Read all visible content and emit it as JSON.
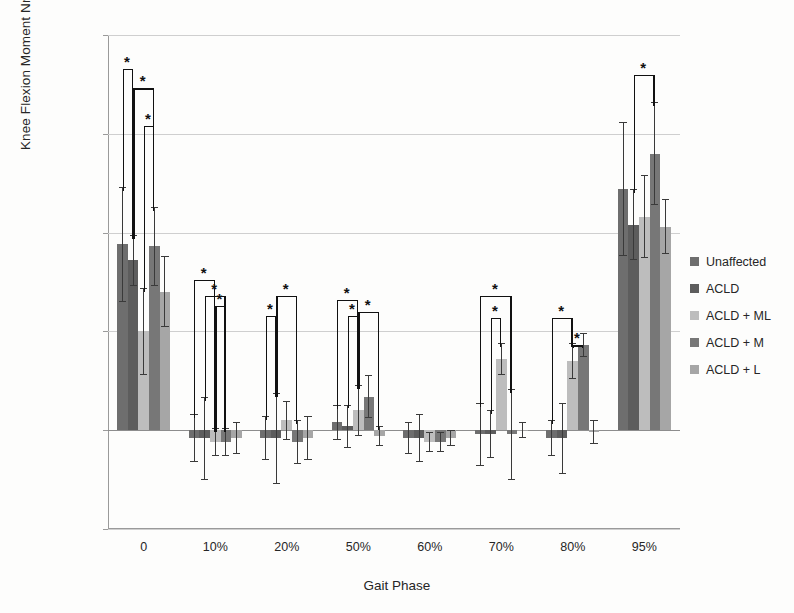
{
  "chart_data": {
    "type": "bar",
    "title": "",
    "xlabel": "Gait Phase",
    "ylabel": "Knee Flexion Moment Nm/Kg·m",
    "categories": [
      "0",
      "10%",
      "20%",
      "50%",
      "60%",
      "70%",
      "80%",
      "95%"
    ],
    "ylim": [
      -0.05,
      0.2
    ],
    "yticks": [
      "0.2",
      "0.15",
      "0.1",
      "0.05",
      "0",
      "-0.05"
    ],
    "ytick_values": [
      0.2,
      0.15,
      0.1,
      0.05,
      0,
      -0.05
    ],
    "grid": true,
    "legend_position": "right",
    "error_bars": "standard deviation",
    "significance_marker": "*",
    "series": [
      {
        "name": "Unaffected",
        "color": "#6e6e6e",
        "values": [
          0.094,
          -0.004,
          -0.004,
          0.004,
          -0.004,
          -0.002,
          -0.004,
          0.122
        ],
        "errors": [
          0.029,
          0.012,
          0.011,
          0.009,
          0.008,
          0.016,
          0.009,
          0.034
        ]
      },
      {
        "name": "ACLD",
        "color": "#5d5d5d",
        "values": [
          0.086,
          -0.004,
          -0.004,
          0.002,
          -0.004,
          -0.002,
          -0.004,
          0.104
        ],
        "errors": [
          0.013,
          0.021,
          0.023,
          0.011,
          0.012,
          0.012,
          0.018,
          0.018
        ]
      },
      {
        "name": "ACLD + ML",
        "color": "#bdbdbd",
        "values": [
          0.05,
          -0.006,
          0.005,
          0.01,
          -0.006,
          0.036,
          0.035,
          0.108
        ],
        "errors": [
          0.022,
          0.007,
          0.01,
          0.013,
          0.005,
          0.008,
          0.009,
          0.021
        ]
      },
      {
        "name": "ACLD + M",
        "color": "#777777",
        "values": [
          0.093,
          -0.006,
          -0.006,
          0.017,
          -0.006,
          -0.002,
          0.043,
          0.14
        ],
        "errors": [
          0.02,
          0.007,
          0.011,
          0.011,
          0.005,
          0.023,
          0.006,
          0.026
        ]
      },
      {
        "name": "ACLD + L",
        "color": "#a6a6a6",
        "values": [
          0.07,
          -0.004,
          -0.004,
          -0.003,
          -0.004,
          0.0,
          -0.001,
          0.103
        ],
        "errors": [
          0.018,
          0.008,
          0.011,
          0.005,
          0.004,
          0.004,
          0.006,
          0.014
        ]
      }
    ],
    "significance_brackets": [
      {
        "group": "0",
        "from": 0,
        "to": 1,
        "top": 0.183,
        "star": true
      },
      {
        "group": "0",
        "from": 1,
        "to": 3,
        "top": 0.173,
        "star": true
      },
      {
        "group": "0",
        "from": 2,
        "to": 3,
        "top": 0.154,
        "star": true
      },
      {
        "group": "10%",
        "from": 0,
        "to": 2,
        "top": 0.076,
        "star": true
      },
      {
        "group": "10%",
        "from": 1,
        "to": 3,
        "top": 0.068,
        "star": true
      },
      {
        "group": "10%",
        "from": 2,
        "to": 3,
        "top": 0.063,
        "star": true
      },
      {
        "group": "20%",
        "from": 0,
        "to": 1,
        "top": 0.058,
        "star": true
      },
      {
        "group": "20%",
        "from": 1,
        "to": 3,
        "top": 0.068,
        "star": true
      },
      {
        "group": "50%",
        "from": 0,
        "to": 2,
        "top": 0.066,
        "star": true
      },
      {
        "group": "50%",
        "from": 1,
        "to": 2,
        "top": 0.058,
        "star": true
      },
      {
        "group": "50%",
        "from": 2,
        "to": 4,
        "top": 0.06,
        "star": true
      },
      {
        "group": "70%",
        "from": 0,
        "to": 3,
        "top": 0.068,
        "star": true
      },
      {
        "group": "70%",
        "from": 1,
        "to": 2,
        "top": 0.057,
        "star": true
      },
      {
        "group": "80%",
        "from": 0,
        "to": 2,
        "top": 0.057,
        "star": true
      },
      {
        "group": "80%",
        "from": 2,
        "to": 3,
        "top": 0.043,
        "star": true
      },
      {
        "group": "95%",
        "from": 1,
        "to": 3,
        "top": 0.18,
        "star": true
      }
    ]
  },
  "legend": {
    "items": [
      {
        "label": "Unaffected",
        "color": "#6e6e6e"
      },
      {
        "label": "ACLD",
        "color": "#5d5d5d"
      },
      {
        "label": "ACLD + ML",
        "color": "#bdbdbd"
      },
      {
        "label": "ACLD + M",
        "color": "#777777"
      },
      {
        "label": "ACLD + L",
        "color": "#a6a6a6"
      }
    ]
  }
}
